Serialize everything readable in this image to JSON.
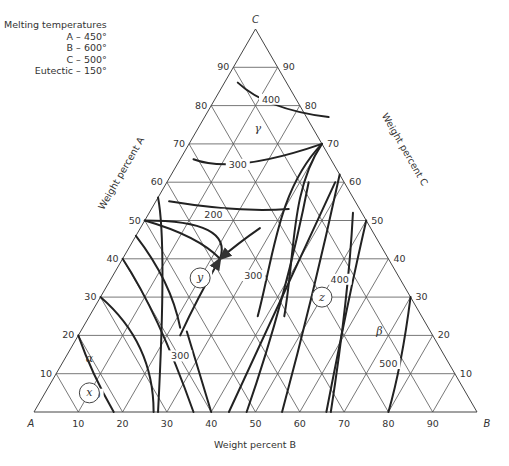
{
  "legend": {
    "title": "Melting temperatures",
    "entries": [
      {
        "label": "A",
        "value": "450°"
      },
      {
        "label": "B",
        "value": "600°"
      },
      {
        "label": "C",
        "value": "500°"
      },
      {
        "label": "Eutectic",
        "value": "150°"
      }
    ]
  },
  "vertices": {
    "A": "A",
    "B": "B",
    "C": "C"
  },
  "axis_titles": {
    "A": "Weight percent A",
    "B": "Weight percent B",
    "C": "Weight percent C"
  },
  "ticks": {
    "B_bottom": [
      "10",
      "20",
      "30",
      "40",
      "50",
      "60",
      "70",
      "80",
      "90"
    ],
    "A_left": [
      "90",
      "80",
      "70",
      "60",
      "50",
      "40",
      "30",
      "20",
      "10"
    ],
    "C_right": [
      "10",
      "20",
      "30",
      "40",
      "50",
      "60",
      "70",
      "80",
      "90"
    ]
  },
  "phases": {
    "alpha": "α",
    "beta": "β",
    "gamma": "γ"
  },
  "points": {
    "x": "x",
    "y": "y",
    "z": "z"
  },
  "isotherm_labels": {
    "gamma_400": "400",
    "gamma_300": "300",
    "gamma_200": "200",
    "alpha_200": "200",
    "alpha_300": "300",
    "alpha_400": "400",
    "beta_300": "300",
    "beta_400": "400",
    "beta_500": "500"
  },
  "chart_data": {
    "type": "ternary_phase_diagram",
    "title": "",
    "components": [
      "A",
      "B",
      "C"
    ],
    "grid_step_percent": 10,
    "melting_temperatures": {
      "A": 450,
      "B": 600,
      "C": 500,
      "Eutectic": 150
    },
    "phase_regions": [
      "alpha",
      "beta",
      "gamma"
    ],
    "marked_compositions": {
      "x": {
        "A": 85,
        "B": 10,
        "C": 5
      },
      "y": {
        "A": 45,
        "B": 20,
        "C": 35
      },
      "z": {
        "A": 20,
        "B": 50,
        "C": 30
      }
    },
    "isotherms_approx": [
      {
        "region": "gamma",
        "T": 400,
        "path_BC": [
          [
            10,
            80
          ],
          [
            20,
            80
          ],
          [
            28,
            76
          ]
        ]
      },
      {
        "region": "gamma",
        "T": 300,
        "path_BC": [
          [
            0,
            68
          ],
          [
            14,
            65
          ],
          [
            30,
            70
          ]
        ]
      },
      {
        "region": "gamma",
        "T": 200,
        "path_BC": [
          [
            0,
            55
          ],
          [
            22,
            52
          ],
          [
            34,
            54
          ]
        ]
      },
      {
        "region": "alpha",
        "T": 400,
        "path_BC": [
          [
            0,
            20
          ],
          [
            10,
            8
          ],
          [
            19,
            0
          ]
        ]
      },
      {
        "region": "alpha",
        "T": 300,
        "path_BC": [
          [
            0,
            35
          ],
          [
            22,
            16
          ],
          [
            36,
            0
          ]
        ]
      },
      {
        "region": "beta",
        "T": 300,
        "path_BC": [
          [
            48,
            0
          ],
          [
            44,
            15
          ],
          [
            55,
            40
          ]
        ]
      },
      {
        "region": "beta",
        "T": 400,
        "path_BC": [
          [
            67,
            0
          ],
          [
            60,
            20
          ],
          [
            50,
            50
          ]
        ]
      },
      {
        "region": "beta",
        "T": 500,
        "path_BC": [
          [
            80,
            0
          ],
          [
            80,
            10
          ],
          [
            70,
            30
          ]
        ]
      }
    ],
    "note": "Isotherm and boundary paths are approximate, traced visually from the image."
  }
}
